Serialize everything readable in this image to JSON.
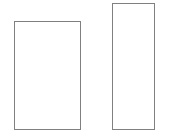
{
  "figure": {
    "background_color": "#ffffff",
    "width": 170,
    "height": 140,
    "stroke_color": "#808080",
    "fill_color": "transparent",
    "stroke_width": 1
  },
  "chart_data": {
    "type": "bar",
    "title": "",
    "subtitle": "",
    "xlabel": "",
    "ylabel": "",
    "grid": false,
    "legend": null,
    "axis_visible": false,
    "tick_labels": [],
    "categories": [
      "",
      ""
    ],
    "values": [
      109,
      127
    ],
    "ylim": [
      0,
      137
    ],
    "baseline_y": 130,
    "bars": [
      {
        "name": "left-bar",
        "label": "",
        "x": 14,
        "y": 21,
        "width": 67,
        "height": 109,
        "value": 109,
        "fill": "transparent",
        "stroke": "#808080"
      },
      {
        "name": "right-bar",
        "label": "",
        "x": 112,
        "y": 3,
        "width": 43,
        "height": 127,
        "value": 127,
        "fill": "transparent",
        "stroke": "#808080"
      }
    ]
  }
}
